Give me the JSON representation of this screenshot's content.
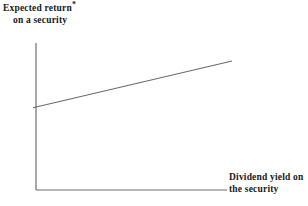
{
  "chart_data": {
    "type": "line",
    "title": "",
    "subtitle": "",
    "ylabel_line1": "Expected return",
    "ylabel_marker": "*",
    "ylabel_line2": "on a security",
    "xlabel_line1": "Dividend yield on",
    "xlabel_line2": "the security",
    "xlabel": "Dividend yield on the security",
    "ylabel": "Expected return* on a security",
    "grid": false,
    "legend": "none",
    "axis_ticks": "none",
    "tick_labels": [],
    "xlim": [
      0,
      1
    ],
    "ylim": [
      0,
      1
    ],
    "series": [
      {
        "name": "expected-return-vs-dividend-yield",
        "style": "straight-line",
        "x": [
          0.0,
          1.0
        ],
        "y": [
          0.565,
          0.878
        ],
        "description": "upward sloping straight line"
      }
    ],
    "annotations": [],
    "colors": {
      "background": "#ffffff",
      "axis": "#6e6e6e",
      "line": "#6b6b6b",
      "text": "#1a1a1a"
    },
    "geometry": {
      "y_axis_x": 36,
      "y_axis_top": 43,
      "y_axis_bottom": 190,
      "x_axis_y": 190,
      "x_axis_left": 36,
      "x_axis_right": 227,
      "line_start": [
        36,
        107
      ],
      "line_end": [
        232,
        61
      ]
    }
  }
}
